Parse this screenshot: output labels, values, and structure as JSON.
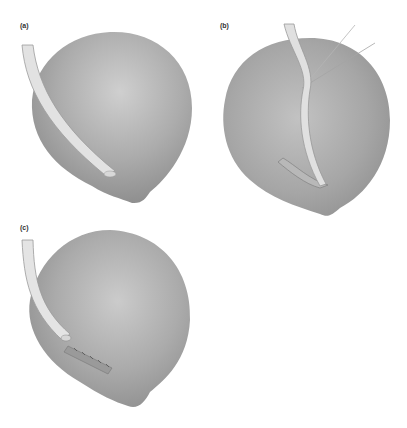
{
  "figure": {
    "panels": [
      {
        "id": "a",
        "label": "(a)",
        "description": "Organ with tube resting along surface"
      },
      {
        "id": "b",
        "label": "(b)",
        "description": "Tube tunnelled beneath serosa, held by stay sutures, exiting incision"
      },
      {
        "id": "c",
        "label": "(c)",
        "description": "Tube tunnel closed with sutures"
      }
    ],
    "colors": {
      "organ_light": "#c4c4c4",
      "organ_mid": "#a9a9a9",
      "organ_dark": "#8e8e8e",
      "tube": "#e4e4e4",
      "tube_edge": "#9a9a9a",
      "background": "#ffffff"
    }
  }
}
